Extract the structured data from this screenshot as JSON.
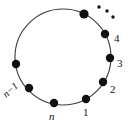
{
  "figure": {
    "type": "diagram",
    "background_color": "#ffffff",
    "stroke_color": "#3a3a3a",
    "dot_color": "#111111",
    "label_color": "#111111",
    "circle": {
      "center_x": 63,
      "center_y": 57,
      "radius": 48,
      "stroke_width": 1.1
    },
    "points": [
      {
        "name": "point-1",
        "label": "1",
        "italic": false,
        "x": 86,
        "y": 99,
        "r": 4.2
      },
      {
        "name": "point-2",
        "label": "2",
        "italic": false,
        "x": 103,
        "y": 82,
        "r": 4.2
      },
      {
        "name": "point-3",
        "label": "3",
        "italic": false,
        "x": 110,
        "y": 58,
        "r": 4.2
      },
      {
        "name": "point-4",
        "label": "4",
        "italic": false,
        "x": 105,
        "y": 34,
        "r": 4.2
      },
      {
        "name": "point-next",
        "label": "",
        "italic": false,
        "x": 84,
        "y": 14,
        "r": 4.6
      },
      {
        "name": "point-left",
        "label": "",
        "italic": false,
        "x": 16,
        "y": 64,
        "r": 4.2
      },
      {
        "name": "point-n-minus-1",
        "label": "n−1",
        "italic": true,
        "x": 29,
        "y": 88,
        "r": 4.2
      },
      {
        "name": "point-n",
        "label": "n",
        "italic": true,
        "x": 54,
        "y": 103,
        "r": 4.2
      }
    ],
    "ellipsis": {
      "name": "ellipsis-dots",
      "dots": [
        {
          "x": 99,
          "y": 7,
          "r": 1.7
        },
        {
          "x": 107,
          "y": 11,
          "r": 1.7
        },
        {
          "x": 113,
          "y": 17,
          "r": 1.7
        }
      ]
    },
    "labels": {
      "one": "1",
      "two": "2",
      "three": "3",
      "four": "4",
      "n": "n",
      "n_minus_1": "n−1"
    }
  }
}
